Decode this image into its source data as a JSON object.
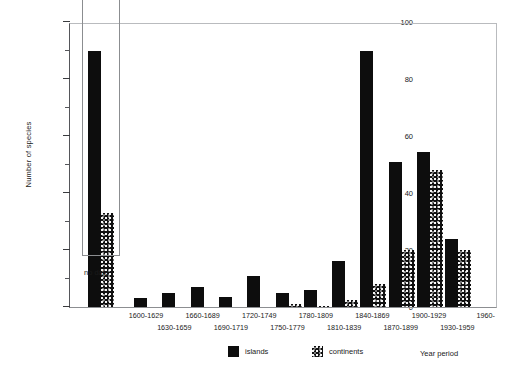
{
  "chart_data": {
    "type": "bar",
    "title": "",
    "xlabel": "Year period",
    "ylabel": "Number of species",
    "ylim": [
      0,
      100
    ],
    "yticks": [
      0,
      20,
      40,
      60,
      80,
      100
    ],
    "yticks_minor": [
      10,
      30,
      50,
      70,
      90
    ],
    "grid": false,
    "legend_position": "bottom-center",
    "categories": [
      "1600-1629",
      "1630-1659",
      "1660-1689",
      "1690-1719",
      "1720-1749",
      "1750-1779",
      "1780-1809",
      "1810-1839",
      "1840-1869",
      "1870-1899",
      "1900-1929",
      "1930-1959",
      "1960-"
    ],
    "series": [
      {
        "name": "islands",
        "values": [
          3,
          5,
          7,
          3.5,
          11,
          5,
          6,
          16,
          90,
          51,
          54.5,
          24,
          0
        ]
      },
      {
        "name": "continents",
        "values": [
          0,
          0,
          0,
          0,
          0,
          1,
          0.5,
          2.5,
          8,
          20,
          48,
          20,
          0
        ]
      }
    ],
    "inset": {
      "label": "no date",
      "categories": [
        "no date"
      ],
      "series": [
        {
          "name": "islands",
          "values": [
            90
          ]
        },
        {
          "name": "continents",
          "values": [
            33
          ]
        }
      ]
    }
  },
  "axes": {
    "y_title": "Number of species",
    "x_title": "Year period",
    "y_tick_labels": [
      "100",
      "80",
      "60",
      "40",
      "20",
      "0"
    ]
  },
  "legend": {
    "items": [
      {
        "label": "islands",
        "swatch": "solid-black-swatch"
      },
      {
        "label": "continents",
        "swatch": "stippled-swatch"
      }
    ]
  },
  "inset_box": {
    "caption": "no date"
  },
  "colors": {
    "islands": "#0d0d0d",
    "continents": "#111111",
    "axis": "#55565a",
    "frame": "#b9bbbe",
    "background": "#ffffff"
  }
}
